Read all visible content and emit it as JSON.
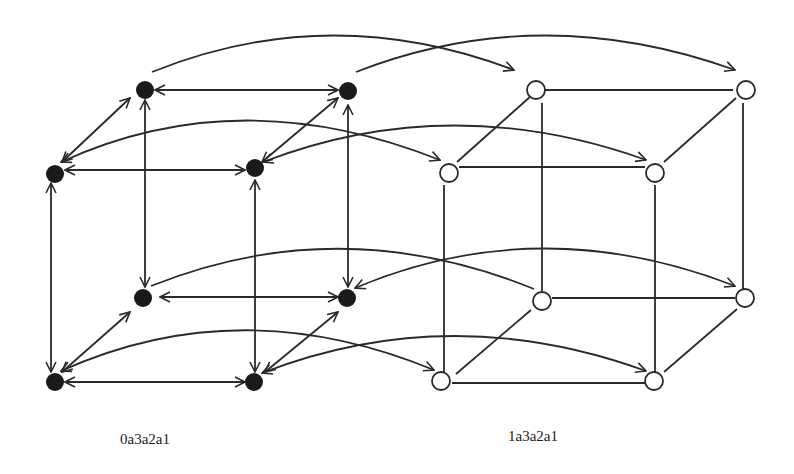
{
  "diagram": {
    "type": "two-cube-hypercube-graph",
    "labels": {
      "left_cube": "0a3a2a1",
      "right_cube": "1a3a2a1"
    },
    "colors": {
      "stroke": "#2a2a2a",
      "filled_node": "#1a1a1a",
      "open_node_fill": "#ffffff",
      "background": "#ffffff"
    },
    "left_cube_nodes": [
      {
        "id": "A",
        "x": 145,
        "y": 90,
        "style": "filled"
      },
      {
        "id": "B",
        "x": 348,
        "y": 90,
        "style": "filled"
      },
      {
        "id": "C",
        "x": 55,
        "y": 173,
        "style": "filled"
      },
      {
        "id": "D",
        "x": 255,
        "y": 170,
        "style": "filled"
      },
      {
        "id": "E",
        "x": 145,
        "y": 297,
        "style": "filled"
      },
      {
        "id": "F",
        "x": 348,
        "y": 297,
        "style": "filled"
      },
      {
        "id": "G",
        "x": 55,
        "y": 382,
        "style": "filled"
      },
      {
        "id": "H",
        "x": 255,
        "y": 382,
        "style": "filled"
      }
    ],
    "right_cube_nodes": [
      {
        "id": "a",
        "x": 524,
        "y": 90,
        "style": "open"
      },
      {
        "id": "b",
        "x": 743,
        "y": 90,
        "style": "open"
      },
      {
        "id": "c",
        "x": 449,
        "y": 173,
        "style": "open"
      },
      {
        "id": "d",
        "x": 655,
        "y": 173,
        "style": "open"
      },
      {
        "id": "e",
        "x": 542,
        "y": 301,
        "style": "open"
      },
      {
        "id": "f",
        "x": 745,
        "y": 299,
        "style": "open"
      },
      {
        "id": "g",
        "x": 442,
        "y": 382,
        "style": "open"
      },
      {
        "id": "h",
        "x": 655,
        "y": 382,
        "style": "open"
      }
    ],
    "left_cube_edges": "bidirectional arrows",
    "right_cube_edges": "plain lines",
    "cross_arcs": [
      {
        "from": "A",
        "to": "a"
      },
      {
        "from": "B",
        "to": "b"
      },
      {
        "from": "C",
        "to": "c"
      },
      {
        "from": "D",
        "to": "d"
      },
      {
        "from": "E",
        "to": "e"
      },
      {
        "from": "F",
        "to": "f"
      },
      {
        "from": "G",
        "to": "g"
      },
      {
        "from": "H",
        "to": "h"
      }
    ]
  }
}
